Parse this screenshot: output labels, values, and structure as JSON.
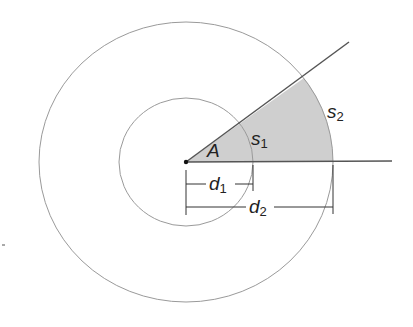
{
  "diagram": {
    "title": "",
    "labels": {
      "angle": "A",
      "arc_inner": {
        "base": "s",
        "sub": "1"
      },
      "arc_outer": {
        "base": "s",
        "sub": "2"
      },
      "dist_inner": {
        "base": "d",
        "sub": "1"
      },
      "dist_outer": {
        "base": "d",
        "sub": "2"
      }
    },
    "colors": {
      "sector_fill": "#cfcfcf",
      "circle_stroke": "#9a9a9a",
      "ray_stroke": "#555555",
      "text": "#222222"
    }
  }
}
